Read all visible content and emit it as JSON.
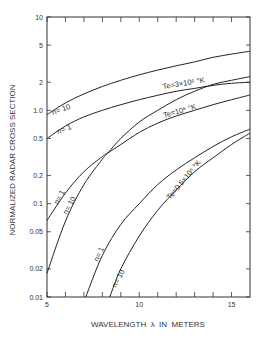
{
  "chart_data": {
    "type": "line",
    "title": "",
    "xlabel": "WAVELENGTH λ IN METERS",
    "ylabel": "NORMALIZED RADAR CROSS SECTION",
    "xscale": "linear",
    "yscale": "log",
    "xlim": [
      5,
      16
    ],
    "ylim": [
      0.01,
      10
    ],
    "x_ticks": [
      5,
      10,
      15
    ],
    "x_minor_ticks": [
      6,
      7,
      8,
      9,
      11,
      12,
      13,
      14
    ],
    "y_ticks": [
      0.01,
      0.02,
      0.05,
      0.1,
      0.2,
      0.5,
      1.0,
      2,
      5,
      10
    ],
    "y_tick_labels": [
      "0.01",
      "0.02",
      "0.05",
      "0.1",
      "0.2",
      "0.5",
      "1.0",
      "2",
      "5",
      "10"
    ],
    "grid": false,
    "legend": "none (inline curve annotations)",
    "series": [
      {
        "name": "Te=3×10^6 °K, n=10",
        "x": [
          5,
          6,
          7,
          8,
          9,
          10,
          11,
          12,
          13,
          14,
          15,
          16
        ],
        "y": [
          0.9,
          1.2,
          1.5,
          1.8,
          2.1,
          2.4,
          2.7,
          3.0,
          3.3,
          3.7,
          4.0,
          4.3
        ]
      },
      {
        "name": "Te=3×10^6 °K, n=1",
        "x": [
          5,
          6,
          7,
          8,
          9,
          10,
          11,
          12,
          13,
          14,
          15,
          16
        ],
        "y": [
          0.5,
          0.68,
          0.85,
          1.0,
          1.15,
          1.3,
          1.45,
          1.6,
          1.72,
          1.85,
          1.95,
          2.0
        ]
      },
      {
        "name": "Te=10^6 °K, n=1",
        "x": [
          5,
          6,
          7,
          8,
          8.3,
          9,
          10,
          11,
          12,
          13,
          14,
          15,
          16
        ],
        "y": [
          0.066,
          0.13,
          0.22,
          0.32,
          0.35,
          0.43,
          0.58,
          0.73,
          0.87,
          1.0,
          1.15,
          1.3,
          1.46
        ]
      },
      {
        "name": "Te=10^6 °K, n=10",
        "x": [
          5,
          6,
          7,
          8,
          8.3,
          9,
          10,
          11,
          12,
          13,
          14,
          15,
          16
        ],
        "y": [
          0.018,
          0.065,
          0.16,
          0.3,
          0.35,
          0.5,
          0.75,
          1.0,
          1.3,
          1.6,
          1.9,
          2.1,
          2.3
        ]
      },
      {
        "name": "Te=0.5×10^6 °K, n=1",
        "x": [
          7.1,
          8,
          9,
          10,
          11,
          12,
          13,
          14,
          15,
          16
        ],
        "y": [
          0.01,
          0.028,
          0.06,
          0.1,
          0.16,
          0.23,
          0.31,
          0.41,
          0.52,
          0.63
        ]
      },
      {
        "name": "Te=0.5×10^6 °K, n=10",
        "x": [
          8.4,
          9,
          10,
          11,
          12,
          13,
          14,
          15,
          16
        ],
        "y": [
          0.01,
          0.02,
          0.045,
          0.085,
          0.14,
          0.22,
          0.31,
          0.43,
          0.57
        ]
      }
    ],
    "annotations": [
      "Te=3×10⁶ °K",
      "Te=10⁶ °K",
      "Te=0.5×10⁶ °K",
      "n=10",
      "n=1",
      "n=1",
      "n=10",
      "n=1",
      "n=10"
    ]
  },
  "labels": {
    "xlabel": "WAVELENGTH  λ  IN  METERS",
    "ylabel": "NORMALIZED RADAR CROSS SECTION",
    "te3": "Te=3×10⁶ °K",
    "te1": "Te=10⁶ °K",
    "te05": "Te=0.5×10⁶ °K",
    "n10": "n= 10",
    "n1": "n= 1"
  },
  "colors": {
    "line": "#222222",
    "axis": "#333333",
    "background": "#ffffff"
  }
}
